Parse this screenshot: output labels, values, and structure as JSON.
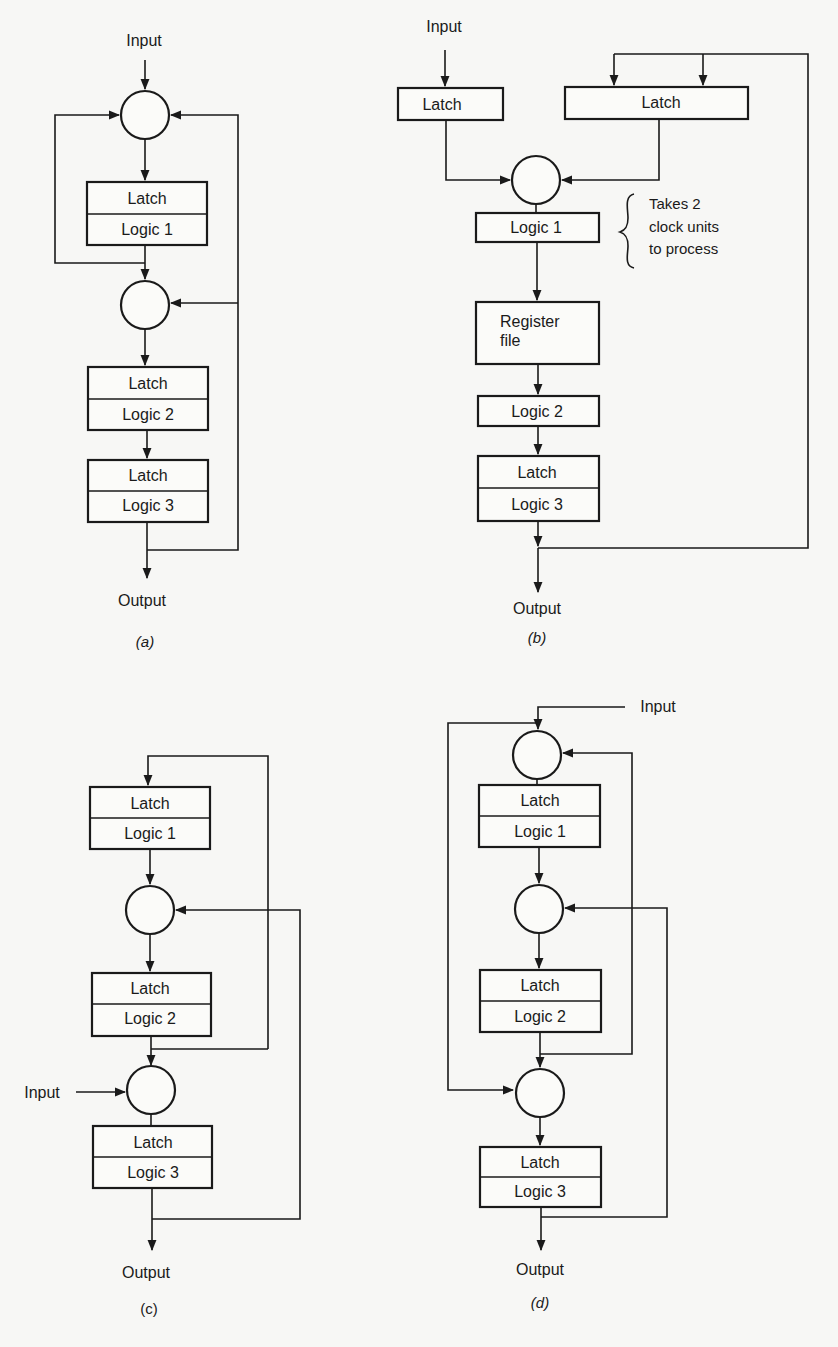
{
  "diagrams": {
    "a": {
      "caption": "(a)",
      "input": "Input",
      "output": "Output",
      "blocks": [
        {
          "latch": "Latch",
          "logic": "Logic 1"
        },
        {
          "latch": "Latch",
          "logic": "Logic 2"
        },
        {
          "latch": "Latch",
          "logic": "Logic 3"
        }
      ]
    },
    "b": {
      "caption": "(b)",
      "input": "Input",
      "output": "Output",
      "latch_left": "Latch",
      "latch_right": "Latch",
      "logic1": "Logic 1",
      "register_file_line1": "Register",
      "register_file_line2": "file",
      "logic2": "Logic 2",
      "latch3": "Latch",
      "logic3": "Logic 3",
      "annotation": [
        "Takes 2",
        "clock units",
        "to process"
      ]
    },
    "c": {
      "caption": "(c)",
      "input": "Input",
      "output": "Output",
      "blocks": [
        {
          "latch": "Latch",
          "logic": "Logic 1"
        },
        {
          "latch": "Latch",
          "logic": "Logic 2"
        },
        {
          "latch": "Latch",
          "logic": "Logic 3"
        }
      ]
    },
    "d": {
      "caption": "(d)",
      "input": "Input",
      "output": "Output",
      "blocks": [
        {
          "latch": "Latch",
          "logic": "Logic 1"
        },
        {
          "latch": "Latch",
          "logic": "Logic 2"
        },
        {
          "latch": "Latch",
          "logic": "Logic 3"
        }
      ]
    }
  }
}
